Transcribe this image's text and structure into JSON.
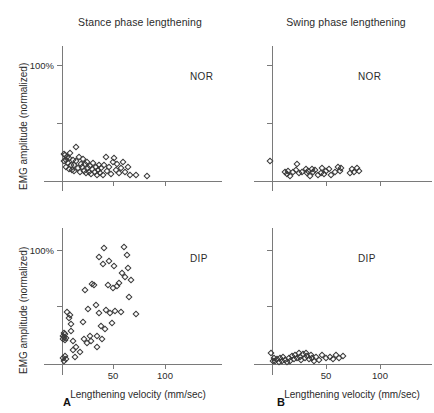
{
  "figure": {
    "column_titles": [
      "Stance phase lengthening",
      "Swing phase lengthening"
    ],
    "panel_letters": [
      "A",
      "B"
    ],
    "row_labels": [
      "NOR",
      "DIP"
    ],
    "axis_titles": {
      "x": "Lengthening velocity (mm/sec)",
      "y": "EMG amplitude (normalized)"
    },
    "x_ticklabels": [
      "50",
      "100"
    ],
    "y_ticklabels": [
      "100%"
    ],
    "marker_color": "#3a3a3a",
    "axis_color": "#7a7a7a",
    "text_color": "#2b2b2b"
  },
  "chart_data": [
    {
      "type": "scatter",
      "panel": "A-top",
      "title": "Stance phase lengthening",
      "group": "NOR",
      "xlabel": "Lengthening velocity (mm/sec)",
      "ylabel": "EMG amplitude (normalized)",
      "xlim": [
        -8,
        115
      ],
      "ylim": [
        -4,
        120
      ],
      "xticks": [
        50,
        100
      ],
      "yticks": [
        50,
        100
      ],
      "ytick_labels": [
        "",
        "100%"
      ],
      "grid": false,
      "legend": "none",
      "points": [
        [
          1.5,
          23.0
        ],
        [
          2.0,
          17.5
        ],
        [
          3.0,
          22.5
        ],
        [
          3.5,
          18.0
        ],
        [
          4.0,
          12.5
        ],
        [
          5.0,
          21.0
        ],
        [
          5.5,
          15.5
        ],
        [
          6.5,
          10.0
        ],
        [
          7.0,
          19.5
        ],
        [
          8.0,
          24.5
        ],
        [
          9.0,
          14.0
        ],
        [
          9.5,
          9.5
        ],
        [
          10.5,
          18.5
        ],
        [
          11.5,
          8.5
        ],
        [
          12.0,
          13.5
        ],
        [
          13.5,
          29.0
        ],
        [
          14.0,
          17.0
        ],
        [
          15.5,
          11.0
        ],
        [
          16.5,
          20.5
        ],
        [
          17.0,
          8.0
        ],
        [
          18.5,
          15.0
        ],
        [
          19.5,
          12.0
        ],
        [
          20.5,
          19.0
        ],
        [
          21.5,
          9.0
        ],
        [
          22.5,
          14.5
        ],
        [
          23.5,
          6.5
        ],
        [
          24.5,
          16.5
        ],
        [
          25.5,
          11.5
        ],
        [
          26.0,
          8.0
        ],
        [
          27.5,
          13.0
        ],
        [
          28.5,
          6.0
        ],
        [
          29.5,
          10.5
        ],
        [
          30.5,
          15.5
        ],
        [
          31.5,
          7.5
        ],
        [
          32.5,
          12.5
        ],
        [
          33.5,
          5.5
        ],
        [
          34.5,
          9.5
        ],
        [
          35.5,
          14.0
        ],
        [
          36.5,
          7.0
        ],
        [
          38.0,
          11.0
        ],
        [
          39.5,
          5.0
        ],
        [
          41.0,
          13.5
        ],
        [
          42.5,
          20.5
        ],
        [
          44.0,
          8.5
        ],
        [
          45.5,
          12.0
        ],
        [
          47.0,
          6.0
        ],
        [
          49.0,
          16.5
        ],
        [
          50.5,
          20.0
        ],
        [
          52.0,
          9.5
        ],
        [
          53.5,
          14.5
        ],
        [
          55.0,
          6.5
        ],
        [
          57.0,
          11.5
        ],
        [
          59.0,
          16.0
        ],
        [
          61.0,
          8.0
        ],
        [
          63.5,
          12.5
        ],
        [
          66.0,
          5.5
        ],
        [
          72.0,
          5.0
        ],
        [
          82.0,
          4.5
        ]
      ]
    },
    {
      "type": "scatter",
      "panel": "B-top",
      "title": "Swing phase lengthening",
      "group": "NOR",
      "xlabel": "Lengthening velocity (mm/sec)",
      "ylabel": "EMG amplitude (normalized)",
      "xlim": [
        -8,
        115
      ],
      "ylim": [
        -4,
        120
      ],
      "xticks": [
        50,
        100
      ],
      "yticks": [
        50,
        100
      ],
      "ytick_labels": [
        "",
        "100%"
      ],
      "grid": false,
      "legend": "none",
      "points": [
        [
          -1.5,
          17.0
        ],
        [
          12.0,
          8.0
        ],
        [
          13.5,
          6.0
        ],
        [
          15.0,
          9.0
        ],
        [
          16.5,
          4.5
        ],
        [
          19.0,
          7.5
        ],
        [
          22.0,
          9.5
        ],
        [
          23.5,
          14.5
        ],
        [
          25.0,
          6.5
        ],
        [
          28.0,
          8.0
        ],
        [
          31.0,
          10.0
        ],
        [
          32.0,
          7.0
        ],
        [
          33.5,
          9.0
        ],
        [
          35.0,
          4.5
        ],
        [
          36.5,
          10.0
        ],
        [
          38.0,
          7.5
        ],
        [
          40.0,
          9.5
        ],
        [
          42.0,
          5.0
        ],
        [
          45.0,
          7.0
        ],
        [
          46.5,
          11.0
        ],
        [
          48.0,
          6.0
        ],
        [
          50.0,
          8.5
        ],
        [
          52.5,
          10.5
        ],
        [
          54.0,
          5.5
        ],
        [
          58.0,
          7.5
        ],
        [
          61.0,
          12.0
        ],
        [
          62.5,
          9.0
        ],
        [
          64.0,
          11.5
        ],
        [
          72.0,
          7.0
        ],
        [
          73.5,
          10.0
        ],
        [
          76.0,
          8.0
        ],
        [
          78.0,
          11.5
        ],
        [
          80.0,
          9.0
        ]
      ]
    },
    {
      "type": "scatter",
      "panel": "A-bottom",
      "title": "Stance phase lengthening",
      "group": "DIP",
      "xlabel": "Lengthening velocity (mm/sec)",
      "ylabel": "EMG amplitude (normalized)",
      "xlim": [
        -8,
        115
      ],
      "ylim": [
        -4,
        120
      ],
      "xticks": [
        50,
        100
      ],
      "yticks": [
        50,
        100
      ],
      "ytick_labels": [
        "",
        "100%"
      ],
      "grid": false,
      "legend": "none",
      "points": [
        [
          0.5,
          25.0
        ],
        [
          1.0,
          22.0
        ],
        [
          1.5,
          27.0
        ],
        [
          2.0,
          24.0
        ],
        [
          2.5,
          21.0
        ],
        [
          3.0,
          26.0
        ],
        [
          3.5,
          23.0
        ],
        [
          1.0,
          5.5
        ],
        [
          2.0,
          3.0
        ],
        [
          2.5,
          7.0
        ],
        [
          3.5,
          4.0
        ],
        [
          4.5,
          46.0
        ],
        [
          6.5,
          40.0
        ],
        [
          7.5,
          43.0
        ],
        [
          8.5,
          35.5
        ],
        [
          9.0,
          29.0
        ],
        [
          10.5,
          20.0
        ],
        [
          11.0,
          12.0
        ],
        [
          12.5,
          6.0
        ],
        [
          14.0,
          15.0
        ],
        [
          17.0,
          10.5
        ],
        [
          20.0,
          37.0
        ],
        [
          21.5,
          22.0
        ],
        [
          22.5,
          65.0
        ],
        [
          24.0,
          18.5
        ],
        [
          25.5,
          48.0
        ],
        [
          27.0,
          25.0
        ],
        [
          28.5,
          20.5
        ],
        [
          29.5,
          70.0
        ],
        [
          31.0,
          69.5
        ],
        [
          32.5,
          52.0
        ],
        [
          33.5,
          24.5
        ],
        [
          34.0,
          15.0
        ],
        [
          35.5,
          45.0
        ],
        [
          36.0,
          94.0
        ],
        [
          37.5,
          33.0
        ],
        [
          38.5,
          22.0
        ],
        [
          39.5,
          88.0
        ],
        [
          40.5,
          102.0
        ],
        [
          42.0,
          30.5
        ],
        [
          43.0,
          47.0
        ],
        [
          44.5,
          69.0
        ],
        [
          45.5,
          90.0
        ],
        [
          46.5,
          44.5
        ],
        [
          48.0,
          36.0
        ],
        [
          49.5,
          67.0
        ],
        [
          50.5,
          86.0
        ],
        [
          51.5,
          46.5
        ],
        [
          53.0,
          68.0
        ],
        [
          55.0,
          71.0
        ],
        [
          57.0,
          45.5
        ],
        [
          58.5,
          80.0
        ],
        [
          60.0,
          103.0
        ],
        [
          61.5,
          76.0
        ],
        [
          62.5,
          96.0
        ],
        [
          63.5,
          84.0
        ],
        [
          65.0,
          59.0
        ],
        [
          67.0,
          74.0
        ],
        [
          72.0,
          44.0
        ]
      ]
    },
    {
      "type": "scatter",
      "panel": "B-bottom",
      "title": "Swing phase lengthening",
      "group": "DIP",
      "xlabel": "Lengthening velocity (mm/sec)",
      "ylabel": "EMG amplitude (normalized)",
      "xlim": [
        -8,
        115
      ],
      "ylim": [
        -4,
        120
      ],
      "xticks": [
        50,
        100
      ],
      "yticks": [
        50,
        100
      ],
      "ytick_labels": [
        "",
        "100%"
      ],
      "grid": false,
      "legend": "none",
      "points": [
        [
          -1.0,
          9.5
        ],
        [
          0.5,
          3.0
        ],
        [
          2.0,
          5.0
        ],
        [
          3.0,
          2.5
        ],
        [
          4.5,
          4.0
        ],
        [
          6.0,
          2.0
        ],
        [
          7.5,
          5.0
        ],
        [
          9.0,
          3.0
        ],
        [
          10.5,
          6.5
        ],
        [
          12.0,
          3.5
        ],
        [
          13.5,
          2.0
        ],
        [
          15.5,
          5.5
        ],
        [
          17.0,
          3.0
        ],
        [
          18.5,
          7.0
        ],
        [
          20.0,
          4.0
        ],
        [
          21.5,
          8.0
        ],
        [
          23.0,
          5.0
        ],
        [
          24.5,
          9.5
        ],
        [
          26.0,
          6.5
        ],
        [
          27.0,
          3.5
        ],
        [
          28.5,
          8.5
        ],
        [
          30.0,
          5.5
        ],
        [
          31.0,
          10.0
        ],
        [
          32.5,
          7.0
        ],
        [
          34.0,
          4.0
        ],
        [
          35.5,
          8.0
        ],
        [
          37.0,
          5.0
        ],
        [
          38.5,
          2.5
        ],
        [
          40.5,
          6.0
        ],
        [
          43.0,
          3.5
        ],
        [
          46.0,
          7.5
        ],
        [
          49.5,
          5.0
        ],
        [
          53.0,
          6.5
        ],
        [
          56.0,
          4.5
        ],
        [
          59.0,
          8.0
        ],
        [
          62.0,
          5.5
        ],
        [
          65.5,
          7.0
        ]
      ]
    }
  ]
}
